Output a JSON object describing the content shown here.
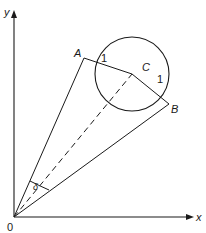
{
  "diagram": {
    "type": "geometry",
    "axes": {
      "x_label": "x",
      "y_label": "y",
      "origin_label": "0"
    },
    "points": {
      "A": "A",
      "B": "B",
      "C": "C"
    },
    "radius_labels": {
      "CA": "1",
      "CB": "1"
    },
    "angle_label": "δ",
    "colors": {
      "stroke": "#1a1a1a",
      "background": "#ffffff"
    }
  }
}
